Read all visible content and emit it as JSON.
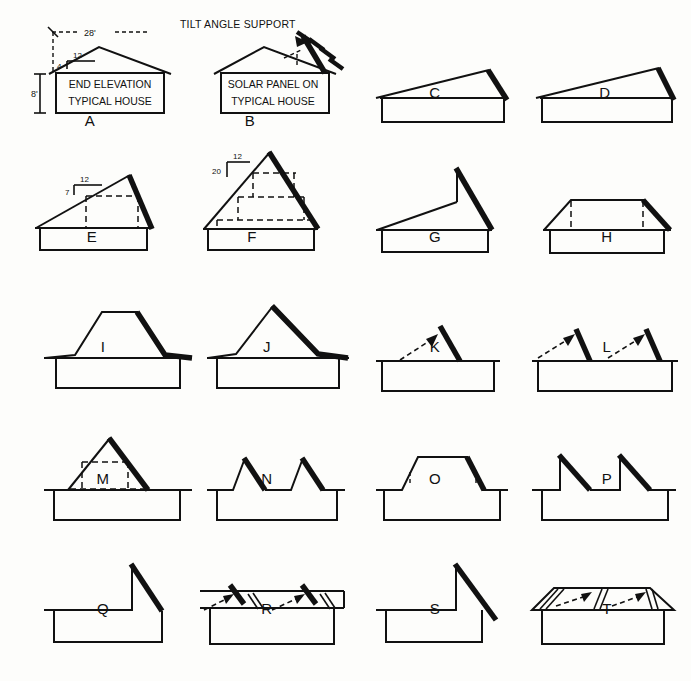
{
  "sheet": {
    "title_a": "END ELEVATION",
    "subtitle_a": "TYPICAL HOUSE",
    "title_b": "SOLAR PANEL ON",
    "subtitle_b": "TYPICAL HOUSE",
    "tilt_label": "TILT ANGLE SUPPORT",
    "dim_width": "28'",
    "dim_height": "8'",
    "slope_a_run": "12",
    "slope_a_rise": "4",
    "slope_e_run": "12",
    "slope_e_rise": "7",
    "slope_f_run": "12",
    "slope_f_rise": "20",
    "ink_color": "#111111",
    "paper_color": "#fdfdfb"
  },
  "figures": [
    {
      "id": "A",
      "label": "A",
      "kind": "gable-house-dimensioned",
      "row": 1,
      "col": 1
    },
    {
      "id": "B",
      "label": "B",
      "kind": "gable-house-tilted-panel",
      "row": 1,
      "col": 2
    },
    {
      "id": "C",
      "label": "C",
      "kind": "shed-roof-low",
      "row": 1,
      "col": 3
    },
    {
      "id": "D",
      "label": "D",
      "kind": "shed-roof-low-wide",
      "row": 1,
      "col": 4
    },
    {
      "id": "E",
      "label": "E",
      "kind": "asymmetric-shed-7-12",
      "row": 2,
      "col": 1
    },
    {
      "id": "F",
      "label": "F",
      "kind": "steep-gable-20-12",
      "row": 2,
      "col": 2
    },
    {
      "id": "G",
      "label": "G",
      "kind": "offset-peak-steep-right",
      "row": 2,
      "col": 3
    },
    {
      "id": "H",
      "label": "H",
      "kind": "hip-roof",
      "row": 2,
      "col": 4
    },
    {
      "id": "I",
      "label": "I",
      "kind": "gambrel-flat-top",
      "row": 3,
      "col": 1
    },
    {
      "id": "J",
      "label": "J",
      "kind": "concave-peak",
      "row": 3,
      "col": 2
    },
    {
      "id": "K",
      "label": "K",
      "kind": "flat-roof-single-panel",
      "row": 3,
      "col": 3
    },
    {
      "id": "L",
      "label": "L",
      "kind": "flat-roof-two-panels",
      "row": 3,
      "col": 4
    },
    {
      "id": "M",
      "label": "M",
      "kind": "triangle-dormer-dashed",
      "row": 4,
      "col": 1
    },
    {
      "id": "N",
      "label": "N",
      "kind": "twin-gable-peaks",
      "row": 4,
      "col": 2
    },
    {
      "id": "O",
      "label": "O",
      "kind": "trapezoid-flat-top-dashed",
      "row": 4,
      "col": 3
    },
    {
      "id": "P",
      "label": "P",
      "kind": "sawtooth-double",
      "row": 4,
      "col": 4
    },
    {
      "id": "Q",
      "label": "Q",
      "kind": "vertical-wall-slope-right",
      "row": 5,
      "col": 1
    },
    {
      "id": "R",
      "label": "R",
      "kind": "flat-roof-panel-rows",
      "row": 5,
      "col": 2
    },
    {
      "id": "S",
      "label": "S",
      "kind": "vertical-wall-overhang-slope",
      "row": 5,
      "col": 3
    },
    {
      "id": "T",
      "label": "T",
      "kind": "perspective-flat-roof-panels",
      "row": 5,
      "col": 4
    }
  ]
}
